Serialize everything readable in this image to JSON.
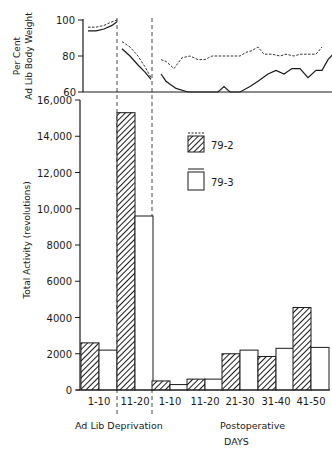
{
  "chart_data": [
    {
      "type": "line",
      "title": "",
      "ylabel": "Per Cent Ad Lib Body Weight",
      "ylabel_lines": [
        "Per Cent",
        "Ad Lib Body Weight"
      ],
      "ylim": [
        60,
        100
      ],
      "yticks": [
        60,
        80,
        100
      ],
      "grid": false,
      "segments": [
        "Ad Lib",
        "Deprivation",
        "Postoperative"
      ],
      "series": [
        {
          "name": "79-2",
          "style": "dashed",
          "points": {
            "ad_lib": [
              [
                88,
                96
              ],
              [
                96,
                96
              ],
              [
                104,
                97
              ],
              [
                112,
                99
              ],
              [
                117,
                100
              ]
            ],
            "deprivation": [
              [
                122,
                88
              ],
              [
                130,
                85
              ],
              [
                138,
                80
              ],
              [
                145,
                74
              ],
              [
                151,
                68
              ]
            ],
            "postoperative": [
              [
                161,
                78
              ],
              [
                166,
                77
              ],
              [
                174,
                73
              ],
              [
                182,
                79
              ],
              [
                190,
                80
              ],
              [
                198,
                78
              ],
              [
                205,
                78
              ],
              [
                212,
                80
              ],
              [
                222,
                80
              ],
              [
                232,
                80
              ],
              [
                240,
                80
              ],
              [
                246,
                82
              ],
              [
                252,
                83
              ],
              [
                258,
                85
              ],
              [
                264,
                81
              ],
              [
                272,
                81
              ],
              [
                280,
                80
              ],
              [
                286,
                81
              ],
              [
                294,
                80
              ],
              [
                300,
                81
              ],
              [
                308,
                81
              ],
              [
                316,
                81
              ],
              [
                322,
                85
              ]
            ]
          }
        },
        {
          "name": "79-3",
          "style": "solid",
          "points": {
            "ad_lib": [
              [
                88,
                94
              ],
              [
                96,
                94
              ],
              [
                104,
                95
              ],
              [
                112,
                97
              ],
              [
                117,
                99
              ]
            ],
            "deprivation": [
              [
                122,
                84
              ],
              [
                130,
                80
              ],
              [
                138,
                75
              ],
              [
                145,
                71
              ],
              [
                151,
                67
              ]
            ],
            "postoperative": [
              [
                161,
                70
              ],
              [
                166,
                66
              ],
              [
                176,
                62
              ],
              [
                188,
                60
              ],
              [
                200,
                60
              ],
              [
                210,
                60
              ],
              [
                218,
                60
              ],
              [
                224,
                63
              ],
              [
                230,
                60
              ],
              [
                240,
                60
              ],
              [
                250,
                63
              ],
              [
                258,
                66
              ],
              [
                268,
                70
              ],
              [
                276,
                72
              ],
              [
                284,
                70
              ],
              [
                292,
                73
              ],
              [
                300,
                73
              ],
              [
                308,
                68
              ],
              [
                316,
                72
              ],
              [
                322,
                72
              ],
              [
                328,
                78
              ],
              [
                333,
                81
              ]
            ]
          }
        }
      ]
    },
    {
      "type": "bar",
      "title": "",
      "xlabel": "DAYS",
      "ylabel": "Total Activity (revolutions)",
      "ylim": [
        0,
        16000
      ],
      "yticks": [
        0,
        2000,
        4000,
        6000,
        8000,
        10000,
        12000,
        14000,
        16000
      ],
      "grid": false,
      "legend_position": "upper right",
      "categories": [
        "1-10",
        "11-20",
        "1-10",
        "11-20",
        "21-30",
        "31-40",
        "41-50"
      ],
      "category_groups": [
        {
          "label": "Ad Lib",
          "categories": [
            "1-10"
          ]
        },
        {
          "label": "Deprivation",
          "categories": [
            "11-20"
          ]
        },
        {
          "label": "Postoperative",
          "categories": [
            "1-10",
            "11-20",
            "21-30",
            "31-40",
            "41-50"
          ]
        }
      ],
      "series": [
        {
          "name": "79-2",
          "pattern": "hatched",
          "line_style": "dashed",
          "values": [
            2600,
            15300,
            500,
            600,
            2000,
            1850,
            4550
          ]
        },
        {
          "name": "79-3",
          "pattern": "open",
          "line_style": "solid",
          "values": [
            2200,
            9600,
            300,
            600,
            2200,
            2300,
            2350
          ]
        }
      ]
    }
  ],
  "labels": {
    "top_ylabel_line1": "Per Cent",
    "top_ylabel_line2": "Ad Lib Body Weight",
    "bottom_ylabel": "Total Activity (revolutions)",
    "top_ticks": [
      "100",
      "80",
      "60"
    ],
    "bottom_ticks": [
      "16,000",
      "14,000",
      "12,000",
      "10,000",
      "8000",
      "6000",
      "4000",
      "2000",
      "0"
    ],
    "categories": [
      "1-10",
      "11-20",
      "1-10",
      "11-20",
      "21-30",
      "31-40",
      "41-50"
    ],
    "group_ad_lib_deprivation": "Ad Lib Deprivation",
    "group_postoperative": "Postoperative",
    "xlabel": "DAYS",
    "legend_1": "79-2",
    "legend_2": "79-3"
  }
}
